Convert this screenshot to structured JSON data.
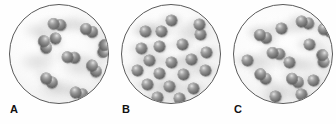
{
  "figure": {
    "title": "",
    "kind": "particle-diagram",
    "panel_count": 3,
    "vessel_shape": "circle",
    "sphere_color": "#6e6e6e",
    "vessel_outline_color": "#5a5a5a",
    "background_color": "#ffffff"
  },
  "panels": [
    {
      "label": "A",
      "content_type": "diatomic molecules",
      "particle_count": 9,
      "atoms_per_particle": 2,
      "total_atoms": 18,
      "particles": [
        {
          "x": 38,
          "y": 14,
          "angle": 10,
          "n": 2
        },
        {
          "x": 70,
          "y": 20,
          "angle": 25,
          "n": 2
        },
        {
          "x": 26,
          "y": 34,
          "angle": 70,
          "n": 2
        },
        {
          "x": 85,
          "y": 38,
          "angle": 100,
          "n": 2
        },
        {
          "x": 52,
          "y": 47,
          "angle": 5,
          "n": 2
        },
        {
          "x": 75,
          "y": 58,
          "angle": 55,
          "n": 2
        },
        {
          "x": 30,
          "y": 70,
          "angle": 35,
          "n": 2
        },
        {
          "x": 60,
          "y": 83,
          "angle": 15,
          "n": 2
        },
        {
          "x": 40,
          "y": 28,
          "angle": 60,
          "n": 1
        }
      ]
    },
    {
      "label": "B",
      "content_type": "single atoms",
      "particle_count": 21,
      "atoms_per_particle": 1,
      "total_atoms": 21,
      "particles": [
        {
          "x": 44,
          "y": 10,
          "angle": 0,
          "n": 1
        },
        {
          "x": 18,
          "y": 21,
          "angle": 0,
          "n": 1
        },
        {
          "x": 34,
          "y": 21,
          "angle": 0,
          "n": 1
        },
        {
          "x": 73,
          "y": 24,
          "angle": 0,
          "n": 1
        },
        {
          "x": 14,
          "y": 38,
          "angle": 0,
          "n": 1
        },
        {
          "x": 32,
          "y": 36,
          "angle": 0,
          "n": 1
        },
        {
          "x": 55,
          "y": 34,
          "angle": 0,
          "n": 1
        },
        {
          "x": 79,
          "y": 42,
          "angle": 0,
          "n": 1
        },
        {
          "x": 22,
          "y": 50,
          "angle": 0,
          "n": 1
        },
        {
          "x": 44,
          "y": 52,
          "angle": 0,
          "n": 1
        },
        {
          "x": 64,
          "y": 49,
          "angle": 0,
          "n": 1
        },
        {
          "x": 10,
          "y": 60,
          "angle": 0,
          "n": 1
        },
        {
          "x": 32,
          "y": 63,
          "angle": 0,
          "n": 1
        },
        {
          "x": 56,
          "y": 64,
          "angle": 0,
          "n": 1
        },
        {
          "x": 78,
          "y": 60,
          "angle": 0,
          "n": 1
        },
        {
          "x": 20,
          "y": 74,
          "angle": 0,
          "n": 1
        },
        {
          "x": 42,
          "y": 76,
          "angle": 0,
          "n": 1
        },
        {
          "x": 66,
          "y": 78,
          "angle": 0,
          "n": 1
        },
        {
          "x": 30,
          "y": 87,
          "angle": 0,
          "n": 1
        },
        {
          "x": 52,
          "y": 88,
          "angle": 0,
          "n": 1
        },
        {
          "x": 72,
          "y": 14,
          "angle": 0,
          "n": 1
        }
      ]
    },
    {
      "label": "C",
      "content_type": "mixture of diatomic molecules and single atoms",
      "particle_count": 14,
      "diatomic_count": 7,
      "monatomic_count": 7,
      "total_atoms": 21,
      "particles": [
        {
          "x": 62,
          "y": 12,
          "angle": 15,
          "n": 2
        },
        {
          "x": 42,
          "y": 18,
          "angle": 0,
          "n": 1
        },
        {
          "x": 20,
          "y": 26,
          "angle": 25,
          "n": 2
        },
        {
          "x": 33,
          "y": 43,
          "angle": 10,
          "n": 2
        },
        {
          "x": 70,
          "y": 34,
          "angle": 0,
          "n": 1
        },
        {
          "x": 80,
          "y": 48,
          "angle": 80,
          "n": 2
        },
        {
          "x": 50,
          "y": 52,
          "angle": 0,
          "n": 1
        },
        {
          "x": 8,
          "y": 50,
          "angle": 0,
          "n": 1
        },
        {
          "x": 20,
          "y": 66,
          "angle": 40,
          "n": 2
        },
        {
          "x": 52,
          "y": 70,
          "angle": 30,
          "n": 2
        },
        {
          "x": 74,
          "y": 70,
          "angle": 0,
          "n": 1
        },
        {
          "x": 36,
          "y": 86,
          "angle": 0,
          "n": 1
        },
        {
          "x": 62,
          "y": 84,
          "angle": 0,
          "n": 1
        },
        {
          "x": 84,
          "y": 20,
          "angle": 20,
          "n": 2
        }
      ]
    }
  ]
}
